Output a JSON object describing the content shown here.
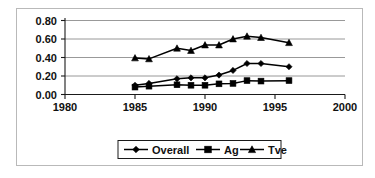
{
  "chart_data": {
    "type": "line",
    "title": "",
    "subtitle": "",
    "xlabel": "",
    "ylabel": "",
    "xlim": [
      1980,
      2000
    ],
    "ylim": [
      0.0,
      0.8
    ],
    "xticks": [
      "1980",
      "1985",
      "1990",
      "1995",
      "2000"
    ],
    "yticks": [
      "0.00",
      "0.20",
      "0.40",
      "0.60",
      "0.80"
    ],
    "xtick_values": [
      1980,
      1985,
      1990,
      1995,
      2000
    ],
    "ytick_values": [
      0.0,
      0.2,
      0.4,
      0.6,
      0.8
    ],
    "grid": "horizontal",
    "legend_position": "bottom",
    "x": [
      1985,
      1986,
      1988,
      1989,
      1990,
      1991,
      1992,
      1993,
      1994,
      1996
    ],
    "series": [
      {
        "name": "Overall",
        "marker": "diamond",
        "color": "#000000",
        "values": [
          0.1,
          0.12,
          0.17,
          0.18,
          0.18,
          0.21,
          0.26,
          0.335,
          0.335,
          0.3
        ]
      },
      {
        "name": "Ag",
        "marker": "square",
        "color": "#000000",
        "values": [
          0.08,
          0.09,
          0.105,
          0.1,
          0.1,
          0.115,
          0.12,
          0.15,
          0.145,
          0.15
        ]
      },
      {
        "name": "Tve",
        "marker": "triangle",
        "color": "#000000",
        "values": [
          0.395,
          0.385,
          0.5,
          0.475,
          0.535,
          0.535,
          0.6,
          0.63,
          0.615,
          0.56
        ]
      }
    ]
  },
  "legend": {
    "items": [
      {
        "label": "Overall",
        "marker": "diamond"
      },
      {
        "label": "Ag",
        "marker": "square"
      },
      {
        "label": "Tve",
        "marker": "triangle"
      }
    ]
  },
  "axes": {
    "y_labels": [
      "0.80",
      "0.60",
      "0.40",
      "0.20",
      "0.00"
    ],
    "x_labels": [
      "1980",
      "1985",
      "1990",
      "1995",
      "2000"
    ]
  }
}
